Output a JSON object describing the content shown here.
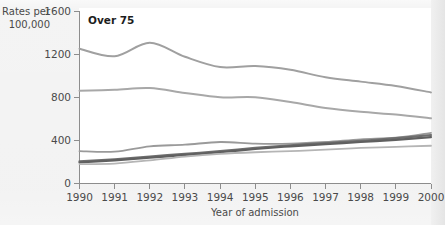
{
  "figure": {
    "panel_title": "Over 75",
    "y_axis_label_line1": "Rates per",
    "y_axis_label_line2": "100,000",
    "x_axis_label": "Year of admission"
  },
  "chart_data": {
    "type": "line",
    "title": "Over 75",
    "xlabel": "Year of admission",
    "ylabel": "Rates per 100,000",
    "xlim": [
      1990,
      2000
    ],
    "ylim": [
      0,
      1600
    ],
    "grid": false,
    "legend": "none",
    "x": [
      1990,
      1991,
      1992,
      1993,
      1994,
      1995,
      1996,
      1997,
      1998,
      1999,
      2000
    ],
    "x_tick_labels": [
      "1990",
      "1991",
      "1992",
      "1993",
      "1994",
      "1995",
      "1996",
      "1997",
      "1998",
      "1999",
      "2000"
    ],
    "y_tick_labels": [
      "0",
      "400",
      "800",
      "1200",
      "1600"
    ],
    "y_ticks": [
      0,
      400,
      800,
      1200,
      1600
    ],
    "series": [
      {
        "name": "series-1",
        "color": "#a0a0a0",
        "width": 2.0,
        "values": [
          1250,
          1180,
          1305,
          1175,
          1080,
          1090,
          1055,
          985,
          945,
          905,
          845
        ]
      },
      {
        "name": "series-2",
        "color": "#a8a8a8",
        "width": 2.0,
        "values": [
          860,
          870,
          885,
          840,
          800,
          800,
          755,
          700,
          665,
          640,
          605
        ]
      },
      {
        "name": "series-3",
        "color": "#9a9a9a",
        "width": 1.8,
        "values": [
          300,
          295,
          345,
          360,
          385,
          370,
          370,
          385,
          410,
          425,
          470
        ]
      },
      {
        "name": "series-4",
        "color": "#6e6e6e",
        "width": 2.2,
        "values": [
          205,
          225,
          250,
          275,
          300,
          330,
          355,
          375,
          395,
          420,
          450
        ]
      },
      {
        "name": "series-5",
        "color": "#606060",
        "width": 2.2,
        "values": [
          195,
          215,
          240,
          265,
          290,
          320,
          345,
          365,
          385,
          405,
          430
        ]
      },
      {
        "name": "series-6",
        "color": "#b5b5b5",
        "width": 1.8,
        "values": [
          180,
          185,
          215,
          250,
          275,
          290,
          300,
          315,
          330,
          340,
          350
        ]
      }
    ]
  }
}
